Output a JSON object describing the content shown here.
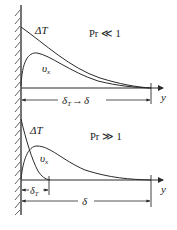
{
  "diagram": {
    "top_panel": {
      "condition": "Pr ≪ 1",
      "curve_temperature_label": "ΔT",
      "curve_velocity_label": "υ",
      "curve_velocity_subscript": "x",
      "axis_label": "y",
      "dimension_label_left": "δ",
      "dimension_label_left_sub": "T",
      "dimension_label_arrow": "→",
      "dimension_label_right": "δ"
    },
    "bottom_panel": {
      "condition": "Pr ≫ 1",
      "curve_temperature_label": "ΔT",
      "curve_velocity_label": "υ",
      "curve_velocity_subscript": "x",
      "axis_label": "y",
      "thermal_thickness_label": "δ",
      "thermal_thickness_sub": "T",
      "velocity_thickness_label": "δ"
    },
    "colors": {
      "line": "#2a2a2a",
      "background": "#ffffff"
    }
  }
}
